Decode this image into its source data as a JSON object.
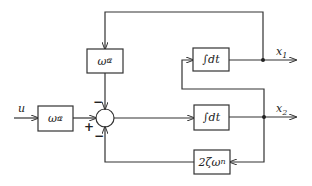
{
  "diagram": {
    "type": "block-diagram",
    "colors": {
      "stroke": "#333333",
      "background": "#ffffff"
    },
    "input": {
      "label": "u"
    },
    "blocks": {
      "input_gain": {
        "base": "ω",
        "sub": "n",
        "sup": "2"
      },
      "feedback_gain": {
        "base": "ω",
        "sub": "n",
        "sup": "2"
      },
      "integrator_1": {
        "label": "∫dt"
      },
      "integrator_2": {
        "label": "∫dt"
      },
      "damping": {
        "label": "2ζω",
        "sub": "n"
      }
    },
    "summing_junction": {
      "signs": {
        "left": "+",
        "top": "−",
        "bottom": "−"
      }
    },
    "outputs": {
      "x1": {
        "base": "x",
        "sub": "1"
      },
      "x2": {
        "base": "x",
        "sub": "2"
      }
    }
  }
}
